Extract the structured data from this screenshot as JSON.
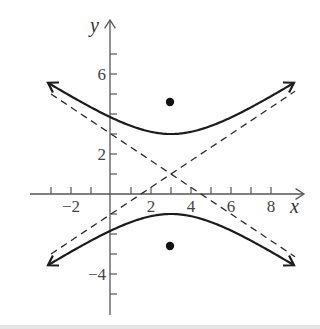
{
  "chart_data": {
    "type": "line",
    "title": "",
    "xlabel": "x",
    "ylabel": "y",
    "xlim": [
      -4,
      9.6
    ],
    "ylim": [
      -6,
      8.6
    ],
    "grid": false,
    "legend": null,
    "x_ticks": [
      -3,
      -2,
      -1,
      1,
      2,
      3,
      4,
      5,
      6,
      7,
      8
    ],
    "x_tick_labels": [
      {
        "value": -2,
        "label": "−2"
      },
      {
        "value": 2,
        "label": "2"
      },
      {
        "value": 4,
        "label": "4"
      },
      {
        "value": 6,
        "label": "6"
      },
      {
        "value": 8,
        "label": "8"
      }
    ],
    "y_ticks": [
      -5,
      -4,
      -3,
      -2,
      -1,
      1,
      2,
      3,
      4,
      5,
      6,
      7
    ],
    "y_tick_labels": [
      {
        "value": 6,
        "label": "6"
      },
      {
        "value": 2,
        "label": "2"
      },
      {
        "value": -4,
        "label": "−4"
      }
    ],
    "series": [
      {
        "name": "hyperbola-upper-branch",
        "style": "solid",
        "equation": "(y-1)^2/4 - (x-3)^2/9 = 1, upper",
        "vertex": [
          3,
          3
        ],
        "x_range": [
          -3.15,
          9.15
        ]
      },
      {
        "name": "hyperbola-lower-branch",
        "style": "solid",
        "equation": "(y-1)^2/4 - (x-3)^2/9 = 1, lower",
        "vertex": [
          3,
          -1
        ],
        "x_range": [
          -3.15,
          9.15
        ]
      },
      {
        "name": "asymptote-1",
        "style": "dashed",
        "equation": "y = 1 + (2/3)(x - 3)",
        "x_range": [
          -3,
          9.2
        ]
      },
      {
        "name": "asymptote-2",
        "style": "dashed",
        "equation": "y = 1 - (2/3)(x - 3)",
        "x_range": [
          -3,
          9.2
        ]
      }
    ],
    "points": [
      {
        "name": "focus-upper",
        "x": 3,
        "y": 4.6
      },
      {
        "name": "focus-lower",
        "x": 3,
        "y": -2.6
      }
    ],
    "center": [
      3,
      1
    ]
  }
}
